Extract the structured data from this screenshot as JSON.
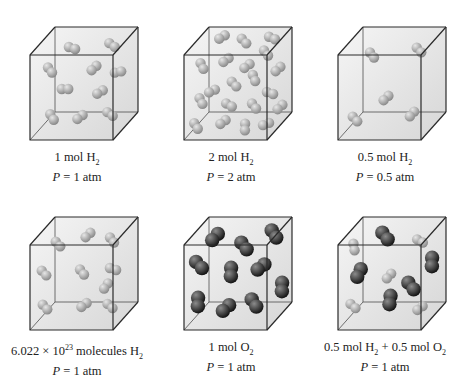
{
  "colors": {
    "cube_edge": "#2a2a2a",
    "cube_fill_light": "#f2f2f2",
    "cube_fill_dark": "#c9c9c9",
    "h2_light": "#e6e6e6",
    "h2_dark": "#8a8a8a",
    "o2_light": "#8c8c8c",
    "o2_dark": "#151515"
  },
  "panels": [
    {
      "id": "1mol-h2",
      "x": 0,
      "y": 0,
      "label_amount": "1 mol H",
      "label_sub": "2",
      "label_suffix": "",
      "pressure_var": "P",
      "pressure_text": " = 1 atm",
      "molecules": [
        {
          "type": "H2",
          "x": 72,
          "y": 48,
          "a": 0.3
        },
        {
          "type": "H2",
          "x": 112,
          "y": 45,
          "a": 0.6
        },
        {
          "type": "H2",
          "x": 50,
          "y": 70,
          "a": 0.9
        },
        {
          "type": "H2",
          "x": 94,
          "y": 68,
          "a": 2.4
        },
        {
          "type": "H2",
          "x": 118,
          "y": 72,
          "a": -0.2
        },
        {
          "type": "H2",
          "x": 65,
          "y": 89,
          "a": 0
        },
        {
          "type": "H2",
          "x": 100,
          "y": 92,
          "a": 2.6
        },
        {
          "type": "H2",
          "x": 52,
          "y": 117,
          "a": 1.0
        },
        {
          "type": "H2",
          "x": 80,
          "y": 117,
          "a": 2.5
        },
        {
          "type": "H2",
          "x": 110,
          "y": 114,
          "a": 0.6
        }
      ]
    },
    {
      "id": "2mol-h2",
      "x": 154,
      "y": 0,
      "label_amount": "2 mol H",
      "label_sub": "2",
      "label_suffix": "",
      "pressure_var": "P",
      "pressure_text": " = 2 atm",
      "molecules": [
        {
          "type": "H2",
          "x": 68,
          "y": 37,
          "a": 2.6
        },
        {
          "type": "H2",
          "x": 90,
          "y": 41,
          "a": 0.8
        },
        {
          "type": "H2",
          "x": 118,
          "y": 38,
          "a": 0.4
        },
        {
          "type": "H2",
          "x": 112,
          "y": 53,
          "a": 0.9
        },
        {
          "type": "H2",
          "x": 48,
          "y": 66,
          "a": 1.1
        },
        {
          "type": "H2",
          "x": 72,
          "y": 60,
          "a": 2.5
        },
        {
          "type": "H2",
          "x": 93,
          "y": 66,
          "a": 2.5
        },
        {
          "type": "H2",
          "x": 124,
          "y": 69,
          "a": 2.4
        },
        {
          "type": "H2",
          "x": 100,
          "y": 78,
          "a": 1.2
        },
        {
          "type": "H2",
          "x": 80,
          "y": 84,
          "a": 0.8
        },
        {
          "type": "H2",
          "x": 58,
          "y": 91,
          "a": 2.7
        },
        {
          "type": "H2",
          "x": 116,
          "y": 93,
          "a": 0.3
        },
        {
          "type": "H2",
          "x": 47,
          "y": 101,
          "a": 1.1
        },
        {
          "type": "H2",
          "x": 75,
          "y": 105,
          "a": 0.5
        },
        {
          "type": "H2",
          "x": 100,
          "y": 106,
          "a": 0.9
        },
        {
          "type": "H2",
          "x": 126,
          "y": 107,
          "a": 2.4
        },
        {
          "type": "H2",
          "x": 42,
          "y": 126,
          "a": 1.0
        },
        {
          "type": "H2",
          "x": 69,
          "y": 122,
          "a": 2.5
        },
        {
          "type": "H2",
          "x": 91,
          "y": 127,
          "a": 1.6
        },
        {
          "type": "H2",
          "x": 112,
          "y": 124,
          "a": 2.8
        }
      ]
    },
    {
      "id": "0.5mol-h2",
      "x": 308,
      "y": 0,
      "label_amount": "0.5 mol H",
      "label_sub": "2",
      "label_suffix": "",
      "pressure_var": "P",
      "pressure_text": " = 0.5 atm",
      "molecules": [
        {
          "type": "H2",
          "x": 64,
          "y": 55,
          "a": 0.9
        },
        {
          "type": "H2",
          "x": 111,
          "y": 50,
          "a": 0.8
        },
        {
          "type": "H2",
          "x": 78,
          "y": 98,
          "a": 2.4
        },
        {
          "type": "H2",
          "x": 47,
          "y": 119,
          "a": 0.8
        },
        {
          "type": "H2",
          "x": 104,
          "y": 114,
          "a": 2.3
        }
      ]
    },
    {
      "id": "avogadro-h2",
      "x": 0,
      "y": 190,
      "label_amount": "6.022 × 10",
      "label_sup": "23",
      "label_amount2": " molecules H",
      "label_sub": "2",
      "label_suffix": "",
      "pressure_var": "P",
      "pressure_text": " = 1 atm",
      "wide": true,
      "molecules": [
        {
          "type": "H2",
          "x": 58,
          "y": 54,
          "a": 0.8
        },
        {
          "type": "H2",
          "x": 88,
          "y": 45,
          "a": 2.4
        },
        {
          "type": "H2",
          "x": 112,
          "y": 50,
          "a": 0.9
        },
        {
          "type": "H2",
          "x": 44,
          "y": 83,
          "a": 0.8
        },
        {
          "type": "H2",
          "x": 82,
          "y": 82,
          "a": 0.9
        },
        {
          "type": "H2",
          "x": 113,
          "y": 79,
          "a": 0.3
        },
        {
          "type": "H2",
          "x": 106,
          "y": 96,
          "a": 2.2
        },
        {
          "type": "H2",
          "x": 45,
          "y": 117,
          "a": 0.8
        },
        {
          "type": "H2",
          "x": 84,
          "y": 115,
          "a": 2.5
        },
        {
          "type": "H2",
          "x": 110,
          "y": 116,
          "a": 0.7
        }
      ]
    },
    {
      "id": "1mol-o2",
      "x": 154,
      "y": 190,
      "label_amount": "1 mol O",
      "label_sub": "2",
      "label_suffix": "",
      "pressure_var": "P",
      "pressure_text": " = 1 atm",
      "molecules": [
        {
          "type": "O2",
          "x": 61,
          "y": 47,
          "a": 2.3
        },
        {
          "type": "O2",
          "x": 90,
          "y": 56,
          "a": 0.9
        },
        {
          "type": "O2",
          "x": 120,
          "y": 44,
          "a": 1.0
        },
        {
          "type": "O2",
          "x": 45,
          "y": 75,
          "a": 0.8
        },
        {
          "type": "O2",
          "x": 77,
          "y": 82,
          "a": 1.6
        },
        {
          "type": "O2",
          "x": 107,
          "y": 77,
          "a": 2.5
        },
        {
          "type": "O2",
          "x": 128,
          "y": 97,
          "a": 1.6
        },
        {
          "type": "O2",
          "x": 44,
          "y": 112,
          "a": 1.6
        },
        {
          "type": "O2",
          "x": 72,
          "y": 118,
          "a": 2.4
        },
        {
          "type": "O2",
          "x": 100,
          "y": 113,
          "a": 1.0
        }
      ]
    },
    {
      "id": "mix-h2-o2",
      "x": 308,
      "y": 190,
      "label_amount": "0.5 mol H",
      "label_sub": "2",
      "label_amount2": " + 0.5 mol O",
      "label_sub2": "2",
      "label_suffix": "",
      "pressure_var": "P",
      "pressure_text": " = 1 atm",
      "wide": true,
      "molecules": [
        {
          "type": "O2",
          "x": 77,
          "y": 46,
          "a": 0.9
        },
        {
          "type": "H2",
          "x": 46,
          "y": 57,
          "a": 1.4
        },
        {
          "type": "H2",
          "x": 112,
          "y": 51,
          "a": 0.5
        },
        {
          "type": "O2",
          "x": 124,
          "y": 72,
          "a": 1.6
        },
        {
          "type": "O2",
          "x": 51,
          "y": 83,
          "a": 2.0
        },
        {
          "type": "H2",
          "x": 81,
          "y": 86,
          "a": 2.3
        },
        {
          "type": "O2",
          "x": 103,
          "y": 96,
          "a": 0.9
        },
        {
          "type": "O2",
          "x": 82,
          "y": 110,
          "a": 1.7
        },
        {
          "type": "H2",
          "x": 45,
          "y": 116,
          "a": 0.7
        },
        {
          "type": "H2",
          "x": 112,
          "y": 118,
          "a": 2.5
        }
      ]
    }
  ]
}
